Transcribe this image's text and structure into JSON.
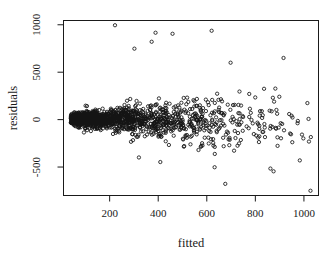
{
  "figure": {
    "background": "#ffffff",
    "width": 333,
    "height": 260
  },
  "chart_data": {
    "type": "scatter",
    "title": "",
    "xlabel": "fitted",
    "ylabel": "residuals",
    "xlim": [
      10,
      1060
    ],
    "ylim": [
      -800,
      1045
    ],
    "x_ticks": [
      200,
      400,
      600,
      800,
      1000
    ],
    "y_ticks": [
      -500,
      0,
      500,
      1000
    ],
    "grid": false,
    "legend": null,
    "frame": "box",
    "colors": {
      "point": "#141414",
      "axis": "#1a1a1a",
      "background": "#ffffff"
    },
    "marker": {
      "shape": "open-circle",
      "radius": 1.65,
      "stroke_width": 0.85
    },
    "point_cloud": {
      "seed": 90125,
      "bands": [
        {
          "x_min": 40,
          "x_max": 150,
          "count": 650
        },
        {
          "x_min": 150,
          "x_max": 300,
          "count": 380
        },
        {
          "x_min": 300,
          "x_max": 450,
          "count": 230
        },
        {
          "x_min": 450,
          "x_max": 600,
          "count": 150
        },
        {
          "x_min": 600,
          "x_max": 750,
          "count": 90
        },
        {
          "x_min": 750,
          "x_max": 900,
          "count": 45
        },
        {
          "x_min": 900,
          "x_max": 1030,
          "count": 18
        }
      ],
      "spread_base": 60,
      "spread_slope": 0.55,
      "spread_max": 420,
      "neg_spread_factor": 1.12,
      "center_base": 8,
      "center_slope": -0.03,
      "tail_prob": 0.08,
      "tail_mult_min": 1.4,
      "tail_mult_range": 1.2,
      "y_clamp": [
        -765,
        1035
      ]
    },
    "outliers": [
      [
        222,
        995
      ],
      [
        389,
        916
      ],
      [
        459,
        905
      ],
      [
        620,
        937
      ],
      [
        373,
        821
      ],
      [
        302,
        748
      ],
      [
        916,
        650
      ],
      [
        698,
        600
      ],
      [
        1027,
        -750
      ],
      [
        862,
        -516
      ],
      [
        875,
        -545
      ],
      [
        983,
        -430
      ]
    ]
  }
}
